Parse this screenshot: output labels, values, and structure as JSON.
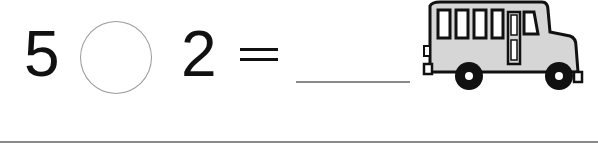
{
  "problem": {
    "left_operand": "5",
    "operator_placeholder": "",
    "right_operand": "2",
    "equals_sign": "=",
    "answer_value": ""
  },
  "illustration": {
    "icon": "school-bus-icon"
  },
  "colors": {
    "text": "#111111",
    "circle_border": "#9a9a9a",
    "lines": "#8a8a8a",
    "bus_body": "#d6d6d6"
  }
}
